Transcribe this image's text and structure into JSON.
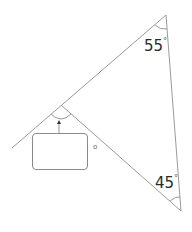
{
  "diagram": {
    "type": "triangle-angle-problem",
    "angles": [
      {
        "id": "top",
        "value": "55",
        "unit": "°"
      },
      {
        "id": "bottom",
        "value": "45",
        "unit": "°"
      }
    ],
    "unknown_angle": {
      "marker": "arrow",
      "answer_box_value": "",
      "unit_mark": "o"
    },
    "colors": {
      "lines": "#8a8a8a",
      "text": "#2a2a2a"
    }
  }
}
